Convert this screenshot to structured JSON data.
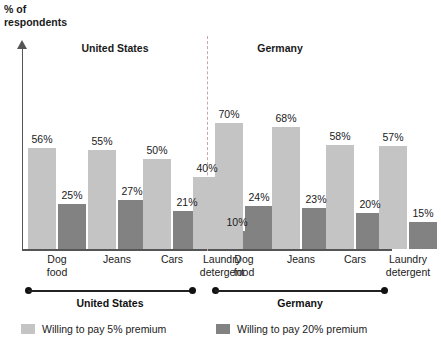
{
  "axis_caption_line1": "% of",
  "axis_caption_line2": "respondents",
  "panels": [
    {
      "heading": "United States",
      "span_label": "United States"
    },
    {
      "heading": "Germany",
      "span_label": "Germany"
    }
  ],
  "legend": [
    {
      "label": "Willing to pay 5% premium",
      "color": "#c4c4c4",
      "swatch_name": "legend-swatch-light"
    },
    {
      "label": "Willing to pay 20% premium",
      "color": "#828282",
      "swatch_name": "legend-swatch-dark"
    }
  ],
  "category_labels": [
    {
      "line1": "Dog",
      "line2": "food"
    },
    {
      "line1": "Jeans",
      "line2": ""
    },
    {
      "line1": "Cars",
      "line2": ""
    },
    {
      "line1": "Laundry",
      "line2": "detergent"
    },
    {
      "line1": "Dog",
      "line2": "food"
    },
    {
      "line1": "Jeans",
      "line2": ""
    },
    {
      "line1": "Cars",
      "line2": ""
    },
    {
      "line1": "Laundry",
      "line2": "detergent"
    }
  ],
  "value_labels": [
    "56%",
    "25%",
    "55%",
    "27%",
    "50%",
    "21%",
    "40%",
    "10%",
    "70%",
    "24%",
    "68%",
    "23%",
    "58%",
    "20%",
    "57%",
    "15%"
  ],
  "chart_data": {
    "type": "bar",
    "title": "",
    "xlabel": "",
    "ylabel": "% of respondents",
    "ylim": [
      0,
      75
    ],
    "grid": false,
    "legend_position": "bottom",
    "panels": [
      "United States",
      "Germany"
    ],
    "categories": [
      "Dog food",
      "Jeans",
      "Cars",
      "Laundry detergent"
    ],
    "series": [
      {
        "name": "Willing to pay 5% premium",
        "color": "#c4c4c4",
        "United States": [
          56,
          55,
          50,
          40
        ],
        "Germany": [
          70,
          68,
          58,
          57
        ]
      },
      {
        "name": "Willing to pay 20% premium",
        "color": "#828282",
        "United States": [
          25,
          27,
          21,
          10
        ],
        "Germany": [
          24,
          23,
          20,
          15
        ]
      }
    ]
  }
}
